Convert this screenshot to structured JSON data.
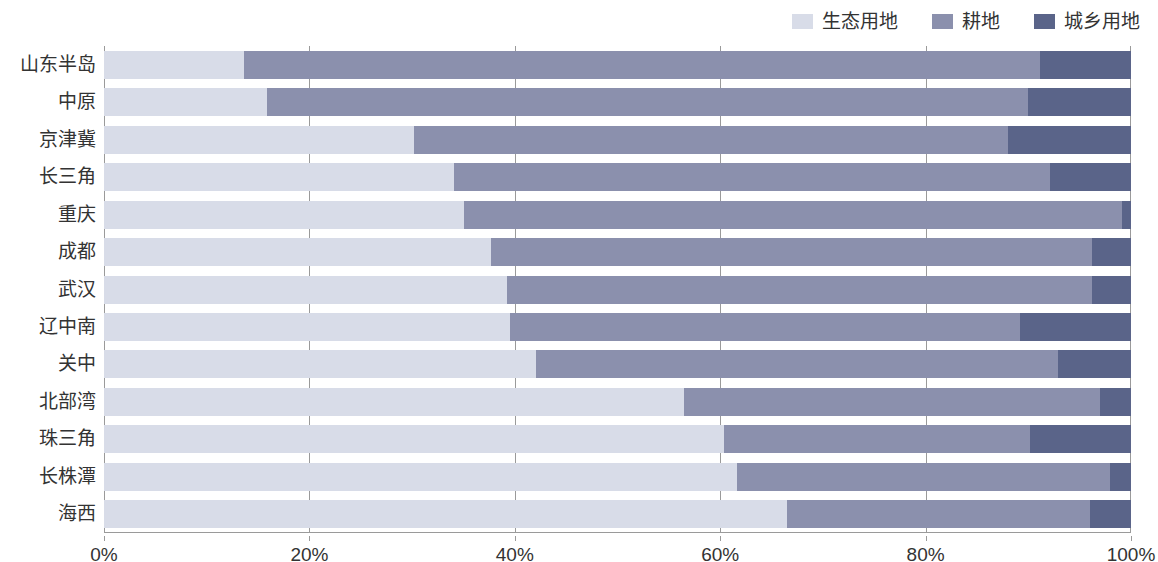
{
  "chart_data": {
    "type": "bar",
    "orientation": "horizontal",
    "stacked": true,
    "normalized": true,
    "title": "",
    "xlabel": "",
    "ylabel": "",
    "xlim": [
      0,
      100
    ],
    "xtick_labels": [
      "0%",
      "20%",
      "40%",
      "60%",
      "80%",
      "100%"
    ],
    "xtick_values": [
      0,
      20,
      40,
      60,
      80,
      100
    ],
    "grid": true,
    "grid_axis": "x",
    "legend_position": "top-right",
    "categories": [
      "山东半岛",
      "中原",
      "京津冀",
      "长三角",
      "重庆",
      "成都",
      "武汉",
      "辽中南",
      "关中",
      "北部湾",
      "珠三角",
      "长株潭",
      "海西"
    ],
    "series": [
      {
        "name": "生态用地",
        "color": "#d8dce8",
        "values": [
          13.6,
          15.9,
          30.2,
          34.1,
          35.1,
          37.7,
          39.2,
          39.5,
          42.1,
          56.5,
          60.4,
          61.6,
          66.5
        ]
      },
      {
        "name": "耕地",
        "color": "#8b90ad",
        "values": [
          77.5,
          74.1,
          57.8,
          58.0,
          64.0,
          58.5,
          57.0,
          49.7,
          50.8,
          40.5,
          29.8,
          36.4,
          29.5
        ]
      },
      {
        "name": "城乡用地",
        "color": "#5a6489",
        "values": [
          8.9,
          10.0,
          12.0,
          7.9,
          0.9,
          3.8,
          3.8,
          10.8,
          7.1,
          3.0,
          9.8,
          2.0,
          4.0
        ]
      }
    ]
  },
  "legend": {
    "items": [
      {
        "label": "生态用地",
        "color": "#d8dce8"
      },
      {
        "label": "耕地",
        "color": "#8b90ad"
      },
      {
        "label": "城乡用地",
        "color": "#5a6489"
      }
    ]
  }
}
